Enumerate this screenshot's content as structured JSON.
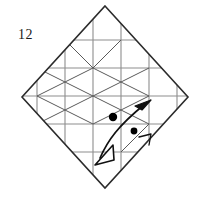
{
  "figure": {
    "step_number": "12",
    "step_number_position": {
      "x": 18,
      "y": 30
    },
    "type": "origami-crease-pattern",
    "canvas": {
      "width": 203,
      "height": 197,
      "background": "#ffffff"
    }
  },
  "colors": {
    "outline": "#2b2b2b",
    "crease_gray": "#8d8d8d",
    "crease_dark": "#5a5a5a",
    "arrow": "#111111",
    "dot": "#000000",
    "label": "#1a1a1a",
    "background": "#ffffff"
  },
  "outline": {
    "name": "diamond-boundary",
    "vertices": [
      {
        "x": 105,
        "y": 6
      },
      {
        "x": 188,
        "y": 97
      },
      {
        "x": 105,
        "y": 188
      },
      {
        "x": 22,
        "y": 97
      }
    ],
    "stroke_width": 1.6
  },
  "grid": {
    "spacing": 28,
    "vertical_lines_x": [
      37,
      65,
      93,
      121,
      149,
      177
    ],
    "horizontal_lines_y": [
      40,
      68,
      96,
      124,
      152
    ],
    "stroke_width": 1.1
  },
  "diagonals": {
    "description": "X crossings in the middle horizontal bands",
    "segments": [
      {
        "x1": 37,
        "y1": 68,
        "x2": 93,
        "y2": 96
      },
      {
        "x1": 93,
        "y1": 68,
        "x2": 37,
        "y2": 96
      },
      {
        "x1": 93,
        "y1": 68,
        "x2": 149,
        "y2": 96
      },
      {
        "x1": 149,
        "y1": 68,
        "x2": 93,
        "y2": 96
      },
      {
        "x1": 37,
        "y1": 96,
        "x2": 93,
        "y2": 124
      },
      {
        "x1": 93,
        "y1": 96,
        "x2": 37,
        "y2": 124
      },
      {
        "x1": 93,
        "y1": 96,
        "x2": 149,
        "y2": 124
      },
      {
        "x1": 149,
        "y1": 96,
        "x2": 93,
        "y2": 124
      },
      {
        "x1": 65,
        "y1": 40,
        "x2": 93,
        "y2": 68
      },
      {
        "x1": 121,
        "y1": 40,
        "x2": 93,
        "y2": 68
      }
    ],
    "stroke_width": 1.0
  },
  "arrow": {
    "name": "double-headed-fold-arrow",
    "path": "M 100 158 C 108 140, 116 126, 146 104",
    "head_filled": {
      "tip": {
        "x": 150,
        "y": 101
      },
      "style": "solid"
    },
    "head_open": {
      "tip": {
        "x": 96,
        "y": 164
      },
      "style": "hollow"
    },
    "stroke_width": 1.7
  },
  "dots": [
    {
      "name": "reference-dot-large",
      "x": 113,
      "y": 117,
      "r": 4.2,
      "style": "filled"
    },
    {
      "name": "reference-dot-small",
      "x": 134,
      "y": 131,
      "r": 3.4,
      "style": "filled"
    }
  ],
  "tick_mark": {
    "name": "alignment-tick",
    "points": [
      {
        "x": 140,
        "y": 139
      },
      {
        "x": 150,
        "y": 135
      },
      {
        "x": 148,
        "y": 144
      }
    ],
    "stroke_width": 1.3
  }
}
